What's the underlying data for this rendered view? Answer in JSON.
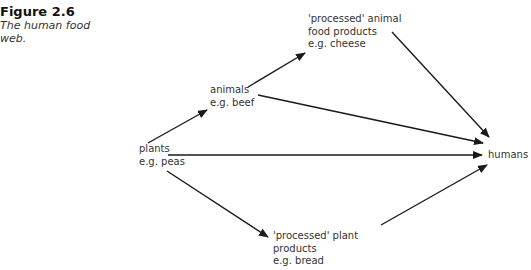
{
  "caption": {
    "number": "Figure 2.6",
    "title_line1": "The human food",
    "title_line2": "web."
  },
  "nodes": {
    "plants": {
      "line1": "plants",
      "line2": "e.g. peas"
    },
    "animals": {
      "line1": "animals",
      "line2": "e.g. beef"
    },
    "processed_animal": {
      "line1": "'processed' animal",
      "line2": "food products",
      "line3": "e.g. cheese"
    },
    "processed_plant": {
      "line1": "'processed' plant",
      "line2": "products",
      "line3": "e.g. bread"
    },
    "humans": {
      "line1": "humans"
    }
  },
  "edges": [
    {
      "from": "plants",
      "to": "animals"
    },
    {
      "from": "plants",
      "to": "humans"
    },
    {
      "from": "plants",
      "to": "processed_plant"
    },
    {
      "from": "animals",
      "to": "processed_animal"
    },
    {
      "from": "animals",
      "to": "humans"
    },
    {
      "from": "processed_animal",
      "to": "humans"
    },
    {
      "from": "processed_plant",
      "to": "humans"
    }
  ],
  "colors": {
    "line": "#1a1a1a",
    "text": "#333333"
  }
}
